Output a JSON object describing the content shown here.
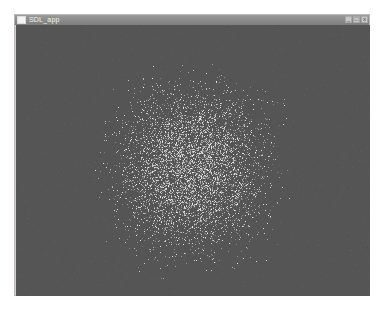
{
  "window": {
    "title": "SDL_app",
    "controls": {
      "minimize": "_",
      "maximize": "□",
      "close": "x"
    }
  },
  "client": {
    "background": "#555555",
    "particle_field": {
      "description": "random white particle noise concentrated in a roughly square region",
      "center_x": 177,
      "center_y": 145,
      "half_width": 82,
      "half_height": 90,
      "count": 9000,
      "particle_color": "#e8e8e8"
    }
  }
}
